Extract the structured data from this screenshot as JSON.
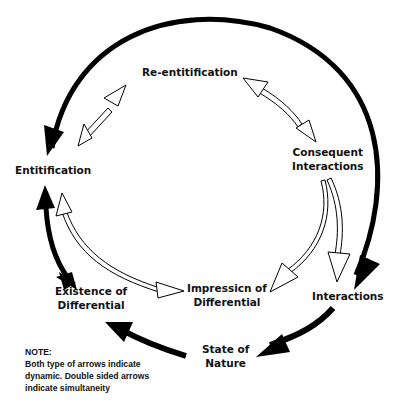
{
  "nodes": {
    "re_entitification": "Re-entitification",
    "consequent_interactions_1": "Consequent",
    "consequent_interactions_2": "Interactions",
    "entitification": "Entitification",
    "existence_1": "Existence of",
    "existence_2": "Differential",
    "impression_1": "Impressicn of",
    "impression_2": "Differential",
    "interactions": "Interactions",
    "state_1": "State of",
    "state_2": "Nature"
  },
  "note": {
    "title": "NOTE:",
    "line1": "Both type of arrows indicate",
    "line2": "dynamic. Double sided arrows",
    "line3": "indicate simultaneity"
  },
  "colors": {
    "arrow_solid": "#000000",
    "arrow_hollow_fill": "#ffffff",
    "text": "#111111"
  }
}
